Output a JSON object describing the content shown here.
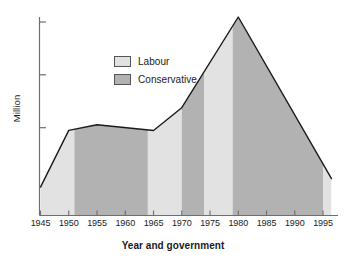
{
  "chart_data": {
    "type": "area",
    "title": "",
    "xlabel": "Year and government",
    "ylabel": "Million",
    "x_tick_labels": [
      "1945",
      "1950",
      "1955",
      "1960",
      "1965",
      "1970",
      "1975",
      "1980",
      "1985",
      "1990",
      "1995"
    ],
    "x_ticks": [
      1945,
      1950,
      1955,
      1960,
      1965,
      1970,
      1975,
      1980,
      1985,
      1990,
      1995
    ],
    "xlim": [
      1945,
      1996.5
    ],
    "y_tick_labels": [],
    "ylim": [
      0,
      14
    ],
    "y_axis_tick_count": 3,
    "grid": false,
    "legend_position": "upper-center",
    "legend": [
      {
        "name": "Labour",
        "color": "#e2e2e2"
      },
      {
        "name": "Conservative",
        "color": "#b2b2b2"
      }
    ],
    "series": [
      {
        "name": "Trade union membership",
        "x": [
          1945,
          1950,
          1955,
          1965,
          1970,
          1980,
          1996.5
        ],
        "values": [
          2.0,
          6.0,
          6.4,
          6.0,
          7.6,
          14.0,
          2.6
        ]
      }
    ],
    "government_bands": [
      {
        "party": "Labour",
        "start": 1945,
        "end": 1951
      },
      {
        "party": "Conservative",
        "start": 1951,
        "end": 1964
      },
      {
        "party": "Labour",
        "start": 1964,
        "end": 1970
      },
      {
        "party": "Conservative",
        "start": 1970,
        "end": 1974
      },
      {
        "party": "Labour",
        "start": 1974,
        "end": 1979
      },
      {
        "party": "Conservative",
        "start": 1979,
        "end": 1995
      },
      {
        "party": "Labour",
        "start": 1995,
        "end": 1996.5
      }
    ]
  },
  "colors": {
    "labour": "#e2e2e2",
    "conservative": "#b2b2b2",
    "line": "#1a1a1a",
    "axis": "#6e6e6e",
    "swatch_border": "#555555",
    "background": "#ffffff"
  }
}
